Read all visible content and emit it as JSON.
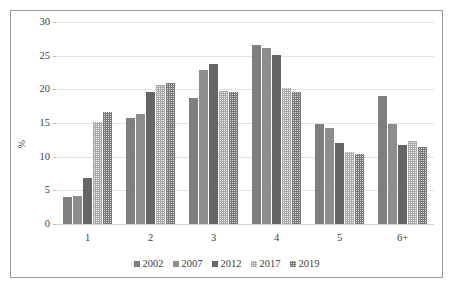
{
  "chart_data": {
    "type": "bar",
    "title": "",
    "subtitle": "",
    "xlabel": "",
    "ylabel": "%",
    "ylim": [
      0,
      30
    ],
    "yticks": [
      0,
      5,
      10,
      15,
      20,
      25,
      30
    ],
    "ytick_labels": [
      "0",
      "5",
      "10",
      "15",
      "20",
      "25",
      "30"
    ],
    "grid": true,
    "legend_position": "bottom",
    "categories": [
      "1",
      "2",
      "3",
      "4",
      "5",
      "6+"
    ],
    "series": [
      {
        "name": "2002",
        "color": "#7f7f7f",
        "pattern": "solid",
        "values": [
          4.0,
          15.7,
          18.7,
          26.6,
          14.9,
          19.0
        ]
      },
      {
        "name": "2007",
        "color": "#8d8d8d",
        "pattern": "solid",
        "values": [
          4.1,
          16.3,
          22.9,
          26.2,
          14.3,
          14.9
        ]
      },
      {
        "name": "2012",
        "color": "#666666",
        "pattern": "solid",
        "values": [
          6.8,
          19.6,
          23.7,
          25.1,
          12.0,
          11.8
        ]
      },
      {
        "name": "2017",
        "color": "#f2f2f2",
        "pattern": "fine-checker-light",
        "values": [
          15.2,
          20.7,
          19.8,
          20.2,
          10.7,
          12.3
        ]
      },
      {
        "name": "2019",
        "color": "#d8d8d8",
        "pattern": "fine-checker-dark",
        "values": [
          16.7,
          21.0,
          19.6,
          19.6,
          10.4,
          11.4
        ]
      }
    ]
  }
}
